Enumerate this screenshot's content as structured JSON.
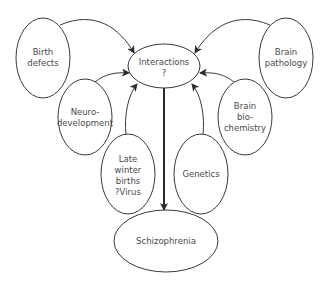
{
  "diagram": {
    "type": "flow-diagram",
    "nodes": {
      "birth_defects": {
        "lines": [
          "Birth",
          "defects"
        ]
      },
      "brain_pathology": {
        "lines": [
          "Brain",
          "pathology"
        ]
      },
      "interactions": {
        "lines": [
          "Interactions",
          "?"
        ]
      },
      "neurodevelopment": {
        "lines": [
          "Neuro-",
          "development"
        ]
      },
      "brain_biochemistry": {
        "lines": [
          "Brain",
          "bio-",
          "chemistry"
        ]
      },
      "late_winter_births": {
        "lines": [
          "Late",
          "winter",
          "births",
          "?Virus"
        ]
      },
      "genetics": {
        "lines": [
          "Genetics"
        ]
      },
      "schizophrenia": {
        "lines": [
          "Schizophrenia"
        ]
      }
    },
    "edges": [
      {
        "from": "Birth defects",
        "to": "Interactions ?"
      },
      {
        "from": "Brain pathology",
        "to": "Interactions ?"
      },
      {
        "from": "Neuro-development",
        "to": "Interactions ?"
      },
      {
        "from": "Brain bio-chemistry",
        "to": "Interactions ?"
      },
      {
        "from": "Late winter births ?Virus",
        "to": "Interactions ?"
      },
      {
        "from": "Genetics",
        "to": "Interactions ?"
      },
      {
        "from": "Interactions ?",
        "to": "Schizophrenia"
      }
    ],
    "colors": {
      "stroke": "#3a3a3a",
      "text": "#4a4a4a",
      "background": "#ffffff"
    }
  }
}
